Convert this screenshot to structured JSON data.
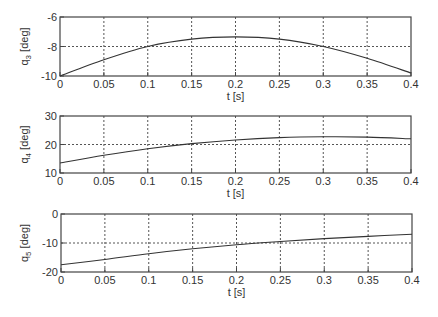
{
  "chart_data": [
    {
      "type": "line",
      "title": "",
      "xlabel": "t [s]",
      "ylabel": "q_3 [deg]",
      "ylabel_main": "q",
      "ylabel_sub": "3",
      "ylabel_unit": "[deg]",
      "xlim": [
        0,
        0.4
      ],
      "ylim": [
        -10,
        -6
      ],
      "xticks": [
        "0",
        "0.05",
        "0.1",
        "0.15",
        "0.2",
        "0.25",
        "0.3",
        "0.35",
        "0.4"
      ],
      "yticks": [
        "-10",
        "-8",
        "-6"
      ],
      "grid": true,
      "x": [
        0,
        0.05,
        0.1,
        0.15,
        0.2,
        0.25,
        0.3,
        0.35,
        0.4
      ],
      "values": [
        -10.0,
        -8.9,
        -8.0,
        -7.5,
        -7.35,
        -7.5,
        -8.0,
        -8.8,
        -9.8
      ]
    },
    {
      "type": "line",
      "title": "",
      "xlabel": "t [s]",
      "ylabel": "q_4 [deg]",
      "ylabel_main": "q",
      "ylabel_sub": "4",
      "ylabel_unit": "[deg]",
      "xlim": [
        0,
        0.4
      ],
      "ylim": [
        10,
        30
      ],
      "xticks": [
        "0",
        "0.05",
        "0.1",
        "0.15",
        "0.2",
        "0.25",
        "0.3",
        "0.35",
        "0.4"
      ],
      "yticks": [
        "10",
        "20",
        "30"
      ],
      "grid": true,
      "x": [
        0,
        0.05,
        0.1,
        0.15,
        0.2,
        0.25,
        0.3,
        0.35,
        0.4
      ],
      "values": [
        13.5,
        16.2,
        18.5,
        20.3,
        21.6,
        22.4,
        22.7,
        22.6,
        22.0
      ]
    },
    {
      "type": "line",
      "title": "",
      "xlabel": "t [s]",
      "ylabel": "q_5 [deg]",
      "ylabel_main": "q",
      "ylabel_sub": "5",
      "ylabel_unit": "[deg]",
      "xlim": [
        0,
        0.4
      ],
      "ylim": [
        -20,
        0
      ],
      "xticks": [
        "0",
        "0.05",
        "0.1",
        "0.15",
        "0.2",
        "0.25",
        "0.3",
        "0.35",
        "0.4"
      ],
      "yticks": [
        "-20",
        "-10",
        "0"
      ],
      "grid": true,
      "x": [
        0,
        0.05,
        0.1,
        0.15,
        0.2,
        0.25,
        0.3,
        0.35,
        0.4
      ],
      "values": [
        -17.5,
        -15.7,
        -13.7,
        -12.0,
        -10.6,
        -9.5,
        -8.5,
        -7.7,
        -7.0
      ]
    }
  ],
  "colors": {
    "line": "#333333",
    "axis": "#444444",
    "grid": "#555555"
  }
}
